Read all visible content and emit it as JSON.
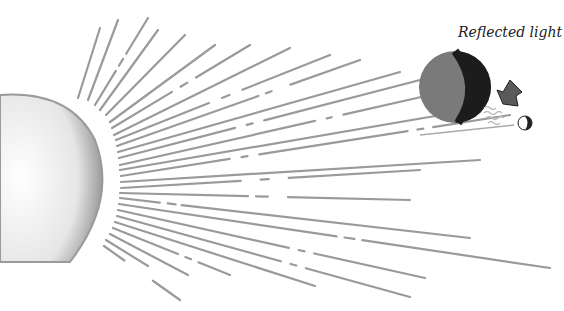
{
  "diagram": {
    "label": "Reflected light",
    "elements": [
      {
        "name": "sun",
        "description": "partial sun disk on left edge"
      },
      {
        "name": "sun-rays",
        "description": "dashed rays radiating right"
      },
      {
        "name": "earth",
        "description": "half-lit globe, right half dark"
      },
      {
        "name": "moon",
        "description": "small half-lit moon"
      },
      {
        "name": "arrow",
        "description": "down-left arrow indicating reflected light"
      }
    ],
    "colors": {
      "ray": "#9a9a9a",
      "sun_edge": "#8f8f8f",
      "earth_lit": "#7a7a7a",
      "earth_dark": "#1c1c1c",
      "arrow": "#555555"
    }
  }
}
